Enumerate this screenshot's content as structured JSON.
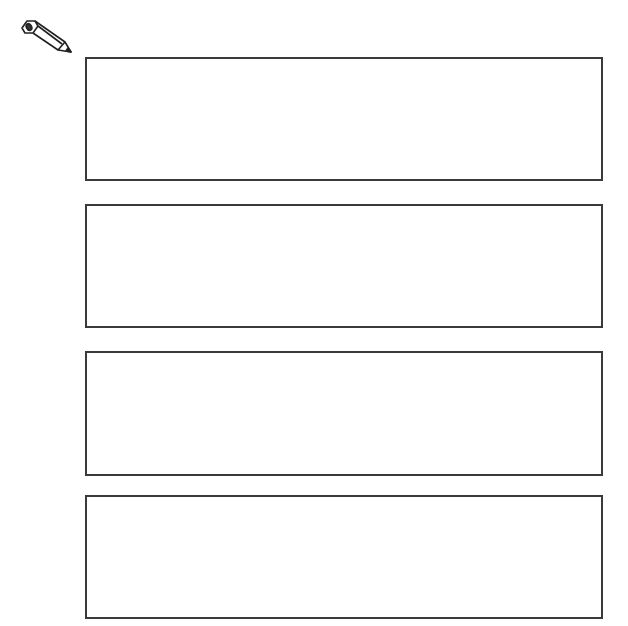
{
  "icon": {
    "name": "pencil-icon"
  },
  "boxes": [
    {
      "id": 1,
      "text": ""
    },
    {
      "id": 2,
      "text": ""
    },
    {
      "id": 3,
      "text": ""
    },
    {
      "id": 4,
      "text": ""
    }
  ],
  "colors": {
    "border": "#3a3a3a",
    "background": "#ffffff"
  }
}
